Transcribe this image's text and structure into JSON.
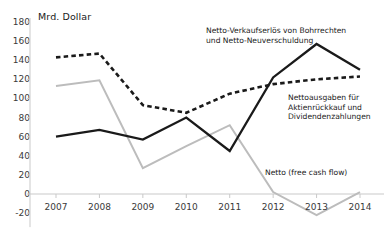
{
  "chart_data": {
    "type": "line",
    "title": "",
    "unit_label": "Mrd. Dollar",
    "xlabel": "",
    "ylabel": "Mrd. Dollar",
    "categories": [
      "2007",
      "2008",
      "2009",
      "2010",
      "2011",
      "2012",
      "2013",
      "2014"
    ],
    "x": [
      2007,
      2008,
      2009,
      2010,
      2011,
      2012,
      2013,
      2014
    ],
    "yticks": [
      -20,
      0,
      20,
      40,
      60,
      80,
      100,
      120,
      140,
      160,
      180
    ],
    "ylim": [
      -20,
      180
    ],
    "grid": false,
    "legend": "annotations",
    "series": [
      {
        "name": "Netto-Verkaufserlös von Bohrrechten und Netto-Neuverschuldung",
        "style": "solid",
        "color": "#1a1a1a",
        "values": [
          60,
          67,
          57,
          80,
          45,
          122,
          157,
          130
        ]
      },
      {
        "name": "Nettoausgaben für Aktienrückkauf und Dividendenzahlungen",
        "style": "dashed",
        "color": "#1a1a1a",
        "values": [
          143,
          147,
          93,
          85,
          105,
          115,
          120,
          123
        ]
      },
      {
        "name": "Netto (free cash flow)",
        "style": "solid",
        "color": "#bcbcbc",
        "values": [
          113,
          119,
          27,
          50,
          72,
          2,
          -22,
          2
        ]
      }
    ],
    "annotations": [
      {
        "name": "annotation-drilling-rights",
        "text": "Netto-Verkaufserlös von Bohrrechten\nund Netto-Neuverschuldung",
        "x": 206,
        "y": 26
      },
      {
        "name": "annotation-buyback-dividends",
        "text": "Nettoausgaben für\nAktienrückkauf und\nDividendenzahlungen",
        "x": 288,
        "y": 93
      },
      {
        "name": "annotation-free-cash-flow",
        "text": "Netto (free cash flow)",
        "x": 265,
        "y": 168
      }
    ]
  }
}
